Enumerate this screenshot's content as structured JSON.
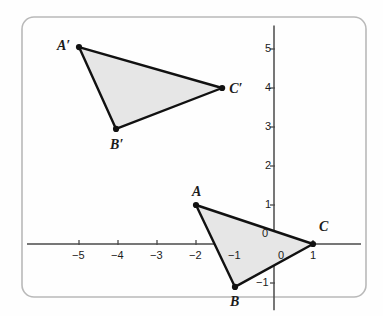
{
  "figure": {
    "kind": "coordinate-plane-diagram",
    "background_color": "#fefefe",
    "border_color": "#b9b9b9",
    "axis_color": "#4a4a4a",
    "shape_stroke_color": "#111111",
    "shape_fill_color": "#e6e6e6",
    "vertex_dot_color": "#111111",
    "frame": {
      "x": 22,
      "y": 17,
      "width": 344,
      "height": 280,
      "radius": 12
    }
  },
  "chart_data": {
    "type": "scatter",
    "title": "",
    "xlabel": "",
    "ylabel": "",
    "grid": false,
    "legend": null,
    "origin_px": {
      "x": 274,
      "y": 244
    },
    "unit_px": {
      "x": 39,
      "y": 39
    },
    "xlim": [
      -6.4,
      2.6
    ],
    "ylim": [
      -1.7,
      5.6
    ],
    "x_tick_labels": [
      "−5",
      "−4",
      "−3",
      "−2",
      "−1",
      "1"
    ],
    "x_tick_values": [
      -5,
      -4,
      -3,
      -2,
      -1,
      1
    ],
    "y_tick_labels": [
      "5",
      "4",
      "3",
      "2",
      "1",
      "−1"
    ],
    "y_tick_values": [
      5,
      4,
      3,
      2,
      1,
      -1
    ],
    "origin_label_x": "0",
    "origin_label_y": "0",
    "series": [
      {
        "name": "Triangle ABC",
        "type": "polygon",
        "closed": true,
        "fill": "#e6e6e6",
        "stroke": "#111111",
        "points": [
          {
            "label": "A",
            "x": -2,
            "y": 1,
            "label_dx": -4,
            "label_dy": -20
          },
          {
            "label": "B",
            "x": -1,
            "y": -1.1,
            "label_dx": -5,
            "label_dy": 8
          },
          {
            "label": "C",
            "x": 1,
            "y": 0,
            "label_dx": 6,
            "label_dy": -24
          }
        ]
      },
      {
        "name": "Triangle A'B'C'",
        "type": "polygon",
        "closed": true,
        "fill": "#e6e6e6",
        "stroke": "#111111",
        "points": [
          {
            "label": "A′",
            "x": -5.0,
            "y": 5.05,
            "label_dx": -22,
            "label_dy": -8
          },
          {
            "label": "B′",
            "x": -4.05,
            "y": 2.95,
            "label_dx": -6,
            "label_dy": 9
          },
          {
            "label": "C′",
            "x": -1.33,
            "y": 4.0,
            "label_dx": 7,
            "label_dy": -6
          }
        ]
      }
    ]
  }
}
